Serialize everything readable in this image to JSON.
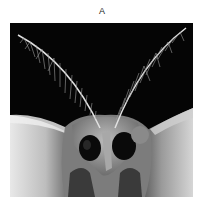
{
  "figure": {
    "panel_label": "A",
    "image": {
      "subject": "moth-head-with-feathery-antennae",
      "mode": "grayscale",
      "background_color": "#050505"
    }
  }
}
